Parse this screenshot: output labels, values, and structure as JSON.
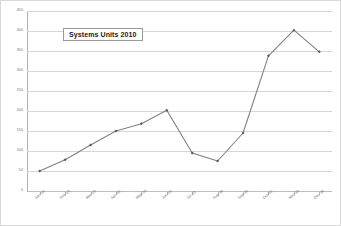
{
  "chart_data": {
    "type": "line",
    "title": "Systems Units 2010",
    "xlabel": "",
    "ylabel": "",
    "categories": [
      "Jan-10",
      "Feb-10",
      "Mar-10",
      "Apr-10",
      "May-10",
      "Jun-10",
      "Jul-10",
      "Aug-10",
      "Sep-10",
      "Oct-10",
      "Nov-10",
      "Dec-10"
    ],
    "values": [
      50,
      78,
      115,
      150,
      168,
      202,
      95,
      75,
      145,
      338,
      402,
      348
    ],
    "series": [
      {
        "name": "Systems Units 2010",
        "values": [
          50,
          78,
          115,
          150,
          168,
          202,
          95,
          75,
          145,
          338,
          402,
          348
        ]
      }
    ],
    "ylim": [
      0,
      450
    ],
    "ytick_step": 50,
    "yticks": [
      0,
      50,
      100,
      150,
      200,
      250,
      300,
      350,
      400,
      450
    ],
    "ytick_labels": [
      "0",
      "50",
      "100",
      "150",
      "200",
      "250",
      "300",
      "350",
      "400",
      "450"
    ],
    "grid": "horizontal",
    "legend": "none",
    "marker": "diamond",
    "colors": {
      "line": "#808080",
      "marker": "#595959",
      "gridline": "#d6d6d6",
      "axis": "#b0b0b0",
      "tick_text": "#6b6b6b",
      "title_text": "#1a1a1a",
      "title_border": "#9a9a9a",
      "frame_border": "#d9d9d9",
      "background": "#ffffff"
    }
  }
}
